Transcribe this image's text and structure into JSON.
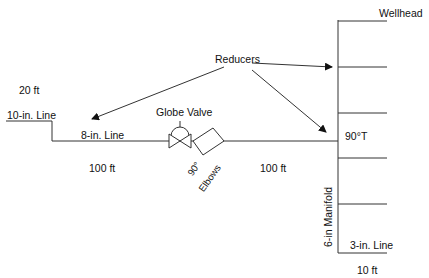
{
  "diagram": {
    "labels": {
      "wellhead": "Wellhead",
      "reducers": "Reducers",
      "dist_20ft": "20 ft",
      "line_10in": "10-in. Line",
      "line_8in": "8-in. Line",
      "globe_valve": "Globe Valve",
      "tee_90": "90°T",
      "dist_100ft_left": "100 ft",
      "dist_100ft_right": "100 ft",
      "elbows_angle": "90°",
      "elbows": "Elbows",
      "manifold_6in": "6-in Manifold",
      "line_3in": "3-in. Line",
      "dist_10ft": "10 ft"
    },
    "colors": {
      "line": "#333333",
      "text": "#111111",
      "background": "#ffffff"
    },
    "manifold_branches": 6
  }
}
